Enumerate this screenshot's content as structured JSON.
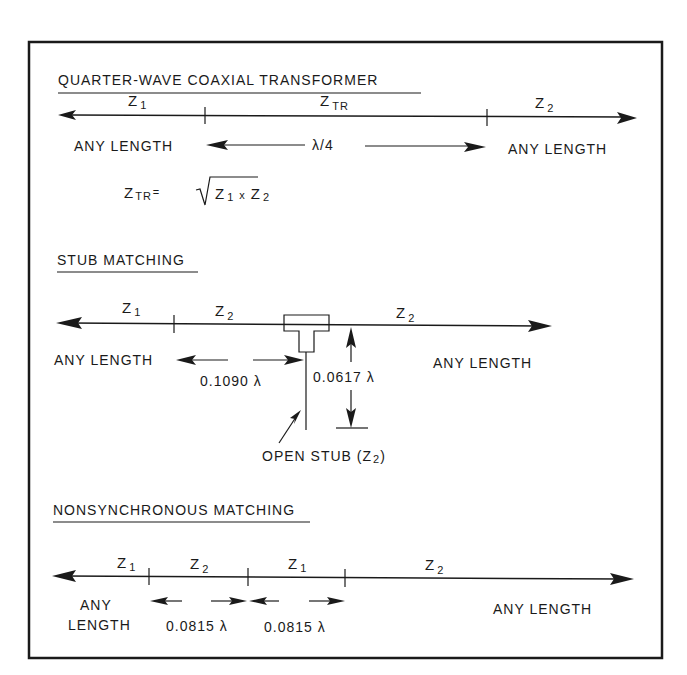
{
  "sections": {
    "quarter_wave": {
      "title": "QUARTER-WAVE COAXIAL TRANSFORMER",
      "segments": [
        {
          "label": "Z",
          "sub": "1"
        },
        {
          "label": "Z",
          "sub": "TR"
        },
        {
          "label": "Z",
          "sub": "2"
        }
      ],
      "left_length": "ANY LENGTH",
      "center_length": "λ/4",
      "right_length": "ANY LENGTH",
      "formula": {
        "lhs": "Z",
        "lhs_sub": "TR",
        "eq": "=",
        "z1": "Z",
        "z1_sub": "1",
        "times": "x",
        "z2": "Z",
        "z2_sub": "2"
      }
    },
    "stub": {
      "title": "STUB MATCHING",
      "segments": [
        {
          "label": "Z",
          "sub": "1"
        },
        {
          "label": "Z",
          "sub": "2"
        },
        {
          "label": "Z",
          "sub": "2"
        }
      ],
      "left_length": "ANY LENGTH",
      "distance": "0.1090 λ",
      "stub_length": "0.0617 λ",
      "right_length": "ANY LENGTH",
      "stub_label": "OPEN STUB (Z",
      "stub_label_sub": "2",
      "stub_label_end": ")"
    },
    "nonsync": {
      "title": "NONSYNCHRONOUS MATCHING",
      "segments": [
        {
          "label": "Z",
          "sub": "1"
        },
        {
          "label": "Z",
          "sub": "2"
        },
        {
          "label": "Z",
          "sub": "1"
        },
        {
          "label": "Z",
          "sub": "2"
        }
      ],
      "left_length_line1": "ANY",
      "left_length_line2": "LENGTH",
      "section1_length": "0.0815 λ",
      "section2_length": "0.0815 λ",
      "right_length": "ANY LENGTH"
    }
  }
}
